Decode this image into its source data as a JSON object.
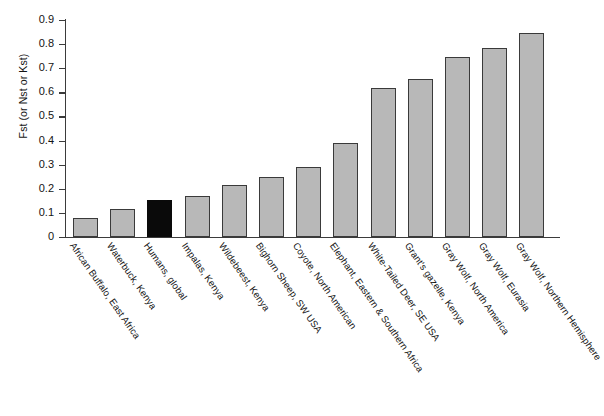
{
  "chart_data": {
    "type": "bar",
    "title": "",
    "subtitle": "",
    "xlabel": "",
    "ylabel": "Fst (or Nst or Kst)",
    "ylim": [
      0,
      0.9
    ],
    "yticks": [
      "0",
      "0.1",
      "0.2",
      "0.3",
      "0.4",
      "0.5",
      "0.6",
      "0.7",
      "0.8",
      "0.9"
    ],
    "ytick_values": [
      0,
      0.1,
      0.2,
      0.3,
      0.4,
      0.5,
      0.6,
      0.7,
      0.8,
      0.9
    ],
    "grid": false,
    "legend": "none",
    "categories": [
      "African Buffalo, East Africa",
      "Waterbuck, Kenya",
      "Humans, global",
      "Impalas, Kenya",
      "Wildebeest, Kenya",
      "Bighorn Sheep, SW USA",
      "Coyote, North American",
      "Elephant, Eastern & Southern Africa",
      "White-Tailed Deer, SE USA",
      "Grant's gazelle, Kenya",
      "Gray Wolf, North America",
      "Gray Wolf, Eurasia",
      "Gray Wolf, Northern Hemisphere"
    ],
    "values": [
      0.08,
      0.115,
      0.155,
      0.17,
      0.215,
      0.25,
      0.29,
      0.39,
      0.62,
      0.655,
      0.745,
      0.785,
      0.845
    ],
    "bar_colors": [
      "#b8b8b8",
      "#b8b8b8",
      "#0a0a0a",
      "#b8b8b8",
      "#b8b8b8",
      "#b8b8b8",
      "#b8b8b8",
      "#b8b8b8",
      "#b8b8b8",
      "#b8b8b8",
      "#b8b8b8",
      "#b8b8b8",
      "#b8b8b8"
    ],
    "highlight_index": 2,
    "bar_edge_color": "#3a3a3a",
    "axis_color": "#3b3b3b",
    "background_color": "#ffffff"
  }
}
